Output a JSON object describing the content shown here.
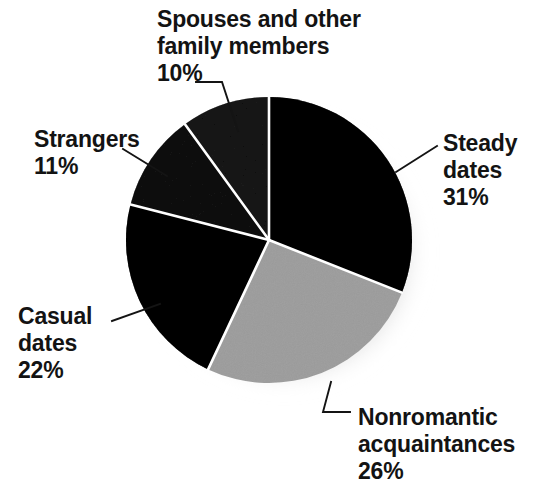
{
  "chart_data": {
    "type": "pie",
    "title": "",
    "subtitle": "",
    "xlabel": "",
    "ylabel": "",
    "legend_position": "none",
    "grid": false,
    "labels_outside": true,
    "start_angle_deg": 0,
    "direction": "clockwise",
    "units": "percent",
    "total": 100,
    "categories": [
      "Steady dates",
      "Nonromantic acquaintances",
      "Casual dates",
      "Strangers",
      "Spouses and other family members"
    ],
    "values": [
      31,
      26,
      22,
      11,
      10
    ],
    "slice_colors": [
      "#151515",
      "#c9c9c9",
      "#111111",
      "#414141",
      "#4c4c4c"
    ],
    "slices": [
      {
        "name": "Steady dates",
        "name_line1": "Steady",
        "name_line2": "dates",
        "value": 31,
        "percent_label": "31%",
        "color": "#151515",
        "start_angle_deg": 0,
        "end_angle_deg": 111.6
      },
      {
        "name": "Nonromantic acquaintances",
        "name_line1": "Nonromantic",
        "name_line2": "acquaintances",
        "value": 26,
        "percent_label": "26%",
        "color": "#c9c9c9",
        "start_angle_deg": 111.6,
        "end_angle_deg": 205.2
      },
      {
        "name": "Casual dates",
        "name_line1": "Casual",
        "name_line2": "dates",
        "value": 22,
        "percent_label": "22%",
        "color": "#111111",
        "start_angle_deg": 205.2,
        "end_angle_deg": 284.4
      },
      {
        "name": "Strangers",
        "name_line1": "Strangers",
        "name_line2": "",
        "value": 11,
        "percent_label": "11%",
        "color": "#414141",
        "start_angle_deg": 284.4,
        "end_angle_deg": 324.0
      },
      {
        "name": "Spouses and other family members",
        "name_line1": "Spouses and other",
        "name_line2": "family members",
        "value": 10,
        "percent_label": "10%",
        "color": "#4c4c4c",
        "start_angle_deg": 324.0,
        "end_angle_deg": 360.0
      }
    ]
  },
  "figure": {
    "background_color": "#ffffff",
    "separator_color": "#ffffff",
    "text_color": "#131313",
    "leader_line_color": "#141414",
    "shadow": true
  }
}
